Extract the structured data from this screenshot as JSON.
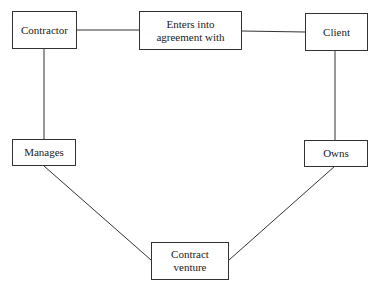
{
  "diagram": {
    "nodes": [
      {
        "id": "contractor",
        "label": "Contractor"
      },
      {
        "id": "agreement",
        "label_line1": "Enters into",
        "label_line2": "agreement with"
      },
      {
        "id": "client",
        "label": "Client"
      },
      {
        "id": "manages",
        "label": "Manages"
      },
      {
        "id": "owns",
        "label": "Owns"
      },
      {
        "id": "venture",
        "label_line1": "Contract",
        "label_line2": "venture"
      }
    ],
    "edges": [
      [
        "contractor",
        "agreement"
      ],
      [
        "agreement",
        "client"
      ],
      [
        "contractor",
        "manages"
      ],
      [
        "client",
        "owns"
      ],
      [
        "manages",
        "venture"
      ],
      [
        "owns",
        "venture"
      ]
    ]
  }
}
